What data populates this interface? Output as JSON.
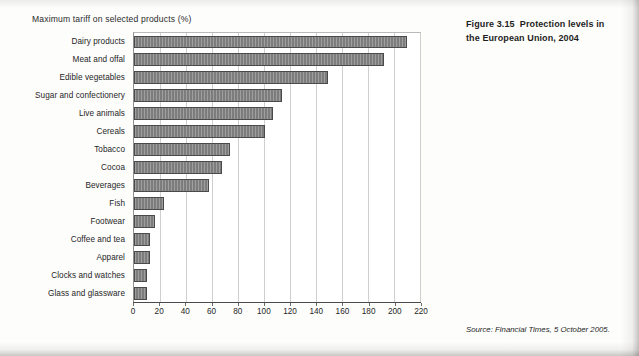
{
  "chart_data": {
    "type": "bar",
    "orientation": "horizontal",
    "title": "Maximum tariff on selected products (%)",
    "xlabel": "",
    "ylabel": "",
    "xlim": [
      0,
      220
    ],
    "xticks": [
      0,
      20,
      40,
      60,
      80,
      100,
      120,
      140,
      160,
      180,
      200,
      220
    ],
    "grid": true,
    "legend": null,
    "bar_color": "#838383",
    "bar_edge_color": "#4a4a4a",
    "categories": [
      "Dairy products",
      "Meat and offal",
      "Edible vegetables",
      "Sugar and confectionery",
      "Live animals",
      "Cereals",
      "Tobacco",
      "Cocoa",
      "Beverages",
      "Fish",
      "Footwear",
      "Coffee and tea",
      "Apparel",
      "Clocks and watches",
      "Glass and glassware"
    ],
    "values": [
      210,
      192,
      149,
      114,
      107,
      101,
      74,
      68,
      58,
      23,
      16,
      12,
      12,
      10,
      10
    ]
  },
  "caption": {
    "figure_number": "Figure 3.15",
    "figure_title": "Protection levels in the European Union, 2004"
  },
  "source": {
    "label": "Source:",
    "publication": "Financial Times",
    "date": ", 5 October 2005."
  }
}
